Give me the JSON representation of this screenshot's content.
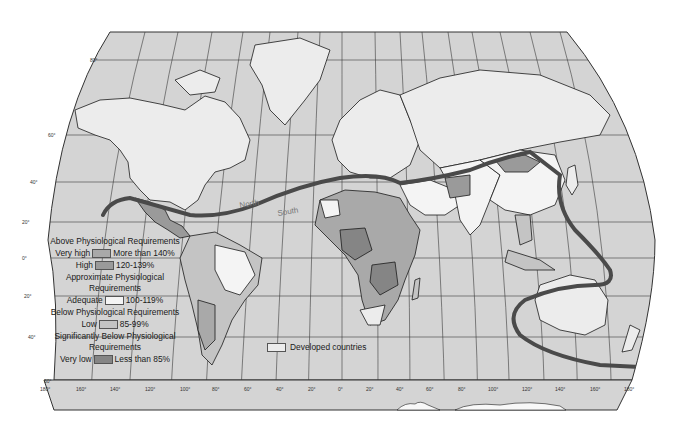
{
  "map": {
    "title": "World Nutrition: Daily Calorie Supply vs. Physiological Requirements",
    "divide_labels": {
      "north": "North",
      "south": "South"
    },
    "latitude_labels": [
      "80°",
      "60°",
      "40°",
      "20°",
      "0°",
      "20°",
      "40°",
      "60°"
    ],
    "longitude_labels": [
      "180°",
      "160°",
      "140°",
      "120°",
      "100°",
      "80°",
      "60°",
      "40°",
      "20°",
      "0°",
      "20°",
      "40°",
      "60°",
      "80°",
      "100°",
      "120°",
      "140°",
      "160°",
      "180°"
    ],
    "colors": {
      "ocean": "#d4d4d4",
      "developed": "#ececec",
      "very_high": "#a9a9a9",
      "high": "#9a9a9a",
      "adequate": "#f4f4f4",
      "low": "#c4c4c4",
      "very_low": "#858585",
      "divide_line": "#4a4a4a",
      "grid": "#3a3a3a"
    }
  },
  "legend": {
    "above_heading": "Above Physiological Requirements",
    "very_high_label": "Very high",
    "very_high_range": "More than 140%",
    "high_label": "High",
    "high_range": "120-139%",
    "approx_heading": "Approximate Physiological Requirements",
    "adequate_label": "Adequate",
    "adequate_range": "100-119%",
    "below_heading": "Below Physiological Requirements",
    "low_label": "Low",
    "low_range": "85-99%",
    "sig_below_heading": "Significantly Below Physiological Requirements",
    "very_low_label": "Very low",
    "very_low_range": "Less than 85%",
    "developed_label": "Developed countries"
  }
}
